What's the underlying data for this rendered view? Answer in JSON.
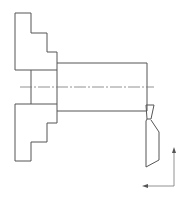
{
  "drawing": {
    "type": "turning-operation-schematic",
    "stroke_color": "#555555",
    "background": "#ffffff",
    "chuck": {
      "upper_jaw": [
        [
          15,
          13
        ],
        [
          31,
          13
        ],
        [
          31,
          33
        ],
        [
          47,
          33
        ],
        [
          47,
          52
        ],
        [
          57,
          52
        ],
        [
          57,
          70
        ],
        [
          15,
          70
        ]
      ],
      "lower_jaw": [
        [
          15,
          104
        ],
        [
          57,
          104
        ],
        [
          57,
          123
        ],
        [
          47,
          123
        ],
        [
          47,
          142
        ],
        [
          31,
          142
        ],
        [
          31,
          161
        ],
        [
          15,
          161
        ]
      ],
      "body_lines_x": [
        31,
        57
      ],
      "body_y": [
        70,
        104
      ]
    },
    "workpiece": {
      "x1": 57,
      "x2": 147,
      "top": 63,
      "bottom": 111
    },
    "centerline": {
      "x1": 20,
      "x2": 154,
      "y": 87,
      "dash": "12 2 2 2"
    },
    "tool": {
      "tip": [
        [
          146,
          105
        ],
        [
          154,
          105
        ],
        [
          151,
          119
        ],
        [
          147,
          119
        ]
      ],
      "body": [
        [
          147,
          119
        ],
        [
          146,
          121
        ],
        [
          146,
          167
        ],
        [
          159,
          160
        ],
        [
          159,
          132
        ],
        [
          151,
          120
        ]
      ]
    },
    "feed_arrows": {
      "vertical": {
        "x": 174,
        "y1": 186,
        "y2": 147,
        "direction": "up"
      },
      "horizontal": {
        "y": 186,
        "x1": 174,
        "x2": 142,
        "direction": "left"
      }
    }
  }
}
